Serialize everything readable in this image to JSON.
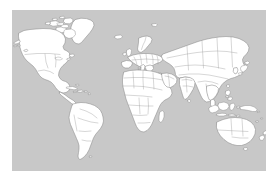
{
  "figure": {
    "name": "world-map",
    "projection": "equirectangular",
    "background_color": "#c8c8c8",
    "land_fill_color": "#ffffff",
    "land_outline_color": "#8a8a8a",
    "border_line_color": "#9a9a9a",
    "page_background_color": "#ffffff",
    "has_labels": false,
    "has_legend": false,
    "has_graticule": false,
    "panel": {
      "left": 12,
      "top": 10,
      "width": 254,
      "height": 161
    }
  },
  "regions": [
    {
      "id": "north-america",
      "label": "North America"
    },
    {
      "id": "greenland",
      "label": "Greenland"
    },
    {
      "id": "canadian-arctic",
      "label": "Canadian Arctic Archipelago"
    },
    {
      "id": "central-america",
      "label": "Central America"
    },
    {
      "id": "caribbean",
      "label": "Caribbean Islands"
    },
    {
      "id": "south-america",
      "label": "South America"
    },
    {
      "id": "europe",
      "label": "Europe"
    },
    {
      "id": "scandinavia",
      "label": "Scandinavia"
    },
    {
      "id": "british-isles",
      "label": "British Isles"
    },
    {
      "id": "iceland",
      "label": "Iceland"
    },
    {
      "id": "africa",
      "label": "Africa"
    },
    {
      "id": "madagascar",
      "label": "Madagascar"
    },
    {
      "id": "asia",
      "label": "Asia"
    },
    {
      "id": "arabian-peninsula",
      "label": "Arabian Peninsula"
    },
    {
      "id": "india",
      "label": "Indian Subcontinent"
    },
    {
      "id": "japan",
      "label": "Japan"
    },
    {
      "id": "southeast-asia",
      "label": "Southeast Asia"
    },
    {
      "id": "philippines",
      "label": "Philippines"
    },
    {
      "id": "indonesia",
      "label": "Indonesia"
    },
    {
      "id": "new-guinea",
      "label": "New Guinea"
    },
    {
      "id": "australia",
      "label": "Australia"
    },
    {
      "id": "new-zealand",
      "label": "New Zealand"
    },
    {
      "id": "sri-lanka",
      "label": "Sri Lanka"
    },
    {
      "id": "svalbard",
      "label": "Svalbard"
    }
  ]
}
